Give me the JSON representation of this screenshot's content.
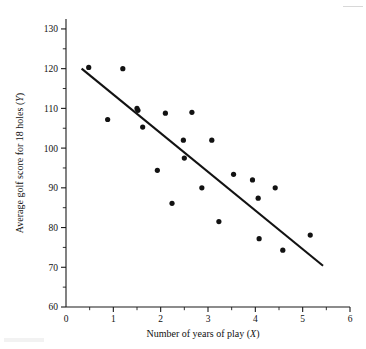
{
  "chart_data": {
    "type": "scatter",
    "title": "",
    "xlabel": "Number of years of play (X)",
    "ylabel": "Average golf score for 18 holes (Y)",
    "xlim": [
      0,
      6
    ],
    "ylim": [
      60,
      130
    ],
    "xticks": [
      0,
      1,
      2,
      3,
      4,
      5,
      6
    ],
    "xtick_labels": [
      "0",
      "1",
      "2",
      "3",
      "4",
      "5",
      "6"
    ],
    "x_minor_ticks": [
      0.5,
      1.5,
      2.5,
      3.5,
      4.5,
      5.5
    ],
    "yticks": [
      60,
      70,
      80,
      90,
      100,
      110,
      120,
      130
    ],
    "ytick_labels": [
      "60",
      "70",
      "80",
      "90",
      "100",
      "110",
      "120",
      "130"
    ],
    "y_minor_ticks": [
      65,
      75,
      85,
      95,
      105,
      115,
      125
    ],
    "grid": false,
    "legend": false,
    "points": [
      {
        "x": 0.48,
        "y": 120.3
      },
      {
        "x": 0.88,
        "y": 107.2
      },
      {
        "x": 1.2,
        "y": 120.0
      },
      {
        "x": 1.5,
        "y": 110.0
      },
      {
        "x": 1.52,
        "y": 109.5
      },
      {
        "x": 1.62,
        "y": 105.3
      },
      {
        "x": 1.93,
        "y": 94.4
      },
      {
        "x": 2.1,
        "y": 108.8
      },
      {
        "x": 2.24,
        "y": 86.1
      },
      {
        "x": 2.48,
        "y": 102.0
      },
      {
        "x": 2.5,
        "y": 97.5
      },
      {
        "x": 2.66,
        "y": 109.0
      },
      {
        "x": 2.87,
        "y": 90.0
      },
      {
        "x": 3.08,
        "y": 102.0
      },
      {
        "x": 3.23,
        "y": 81.5
      },
      {
        "x": 3.54,
        "y": 93.4
      },
      {
        "x": 3.94,
        "y": 92.0
      },
      {
        "x": 4.06,
        "y": 87.4
      },
      {
        "x": 4.08,
        "y": 77.2
      },
      {
        "x": 4.42,
        "y": 90.0
      },
      {
        "x": 4.58,
        "y": 74.3
      },
      {
        "x": 5.16,
        "y": 78.1
      }
    ],
    "fit_line": {
      "name": "least-squares regression line",
      "x_start": 0.33,
      "y_start": 120.0,
      "x_end": 5.43,
      "y_end": 70.4
    }
  }
}
